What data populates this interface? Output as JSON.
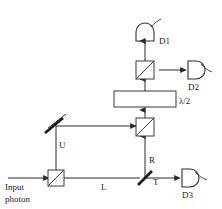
{
  "figure": {
    "background_color": "#ffffff",
    "line_color": "#2b2b2b",
    "width": 222,
    "height": 209
  },
  "labels": {
    "input": {
      "line1": "Input",
      "line2": "photon"
    },
    "path_upper": "U",
    "path_lower": "L",
    "reflected": "R",
    "transmitted": "T",
    "wave_plate": "λ/2",
    "detector1": "D1",
    "detector2": "D2",
    "detector3": "D3"
  },
  "components": [
    {
      "name": "input-beam-splitter",
      "type": "beam-splitter-cube",
      "label": ""
    },
    {
      "name": "steering-mirror",
      "type": "mirror",
      "label": ""
    },
    {
      "name": "combining-beam-splitter",
      "type": "beam-splitter-cube",
      "label": ""
    },
    {
      "name": "half-wave-plate",
      "type": "wave-plate",
      "label": "λ/2"
    },
    {
      "name": "analyzer-beam-splitter",
      "type": "beam-splitter-cube",
      "label": ""
    },
    {
      "name": "lower-beam-splitter",
      "type": "beam-splitter-plate",
      "label": ""
    },
    {
      "name": "detector-d1",
      "type": "detector",
      "label": "D1"
    },
    {
      "name": "detector-d2",
      "type": "detector",
      "label": "D2"
    },
    {
      "name": "detector-d3",
      "type": "detector",
      "label": "D3"
    }
  ],
  "beam_paths": [
    {
      "name": "input-beam",
      "from": "Input photon",
      "to": "input-beam-splitter",
      "label": ""
    },
    {
      "name": "upper-path",
      "from": "input-beam-splitter",
      "to": "steering-mirror",
      "label": "U"
    },
    {
      "name": "upper-path-horizontal",
      "from": "steering-mirror",
      "to": "combining-beam-splitter",
      "label": ""
    },
    {
      "name": "lower-path",
      "from": "input-beam-splitter",
      "to": "lower-beam-splitter",
      "label": "L"
    },
    {
      "name": "reflected-path",
      "from": "lower-beam-splitter",
      "to": "combining-beam-splitter",
      "label": "R"
    },
    {
      "name": "transmitted-path",
      "from": "lower-beam-splitter",
      "to": "detector-d3",
      "label": "T"
    },
    {
      "name": "waveplate-input",
      "from": "combining-beam-splitter",
      "to": "half-wave-plate",
      "label": ""
    },
    {
      "name": "waveplate-output",
      "from": "half-wave-plate",
      "to": "analyzer-beam-splitter",
      "label": ""
    },
    {
      "name": "d1-path",
      "from": "analyzer-beam-splitter",
      "to": "detector-d1",
      "label": ""
    },
    {
      "name": "d2-path",
      "from": "analyzer-beam-splitter",
      "to": "detector-d2",
      "label": ""
    }
  ]
}
